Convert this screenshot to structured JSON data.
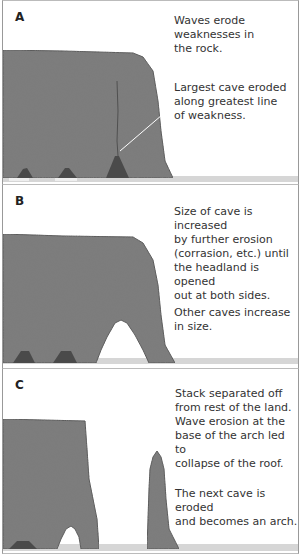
{
  "panels": [
    {
      "letter": "A",
      "captions": [
        [
          "Waves erode",
          "weaknesses in",
          "the rock."
        ],
        [
          "Largest cave eroded",
          "along greatest line",
          "of weakness."
        ]
      ]
    },
    {
      "letter": "B",
      "captions": [
        [
          "Size of cave is increased",
          "by further erosion",
          "(corrasion, etc.) until",
          "the headland is opened",
          "out at both sides."
        ],
        [
          "Other caves increase",
          "in size."
        ]
      ]
    },
    {
      "letter": "C",
      "captions": [
        [
          "Stack separated off",
          "from rest of the land.",
          "Wave erosion at the",
          "base of the arch led to",
          "collapse of the roof."
        ],
        [
          "The next cave is eroded",
          "and becomes an arch."
        ]
      ]
    }
  ],
  "colors": {
    "rock": "#7a7a7a",
    "rock_dark": "#555555",
    "sea": "#d6d6d6",
    "border": "#999999",
    "text": "#333333"
  }
}
